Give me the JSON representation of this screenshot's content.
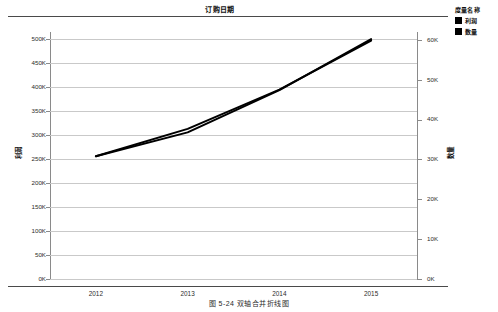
{
  "figure": {
    "caption": "图 5-24   双轴合并折线图"
  },
  "chart_data": {
    "type": "line",
    "title": "订购日期",
    "xlabel": "",
    "categories": [
      "2012",
      "2013",
      "2014",
      "2015"
    ],
    "grid": true,
    "legend_position": "right",
    "legend_title": "度量名称",
    "axes": {
      "left": {
        "label": "利润",
        "ticks": [
          "0K",
          "50K",
          "100K",
          "150K",
          "200K",
          "250K",
          "300K",
          "350K",
          "400K",
          "450K",
          "500K"
        ],
        "tick_values": [
          0,
          50000,
          100000,
          150000,
          200000,
          250000,
          300000,
          350000,
          400000,
          450000,
          500000
        ],
        "ylim": [
          0,
          515000
        ]
      },
      "right": {
        "label": "数量",
        "ticks": [
          "0K",
          "10K",
          "20K",
          "30K",
          "40K",
          "50K",
          "60K"
        ],
        "tick_values": [
          0,
          10000,
          20000,
          30000,
          40000,
          50000,
          60000
        ],
        "ylim": [
          0,
          62000
        ]
      }
    },
    "series": [
      {
        "name": "利润",
        "axis": "left",
        "color": "#000000",
        "values": [
          256000,
          313000,
          395000,
          497000
        ]
      },
      {
        "name": "数量",
        "axis": "right",
        "color": "#000000",
        "values": [
          30800,
          36800,
          47400,
          60200
        ]
      }
    ]
  }
}
